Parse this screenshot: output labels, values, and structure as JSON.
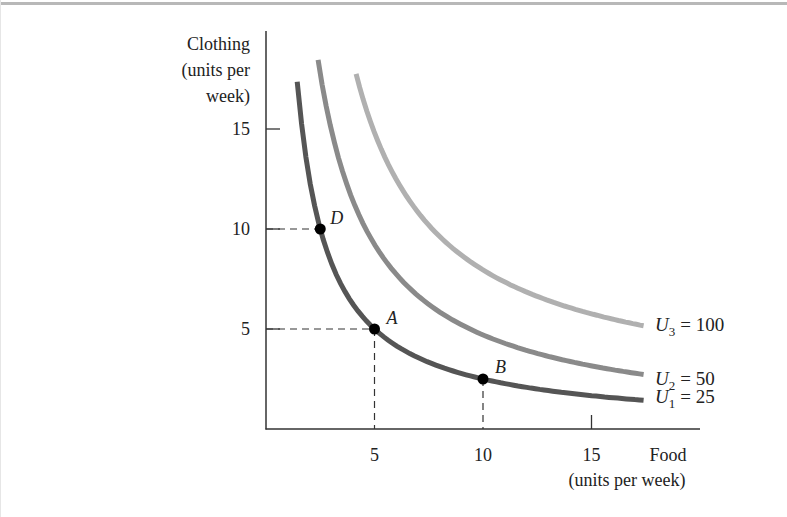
{
  "chart_data": {
    "type": "line",
    "title": "",
    "ylabel": [
      "Clothing",
      "(units per",
      "week)"
    ],
    "xlabel": [
      "Food",
      "(units per week)"
    ],
    "xlim": [
      0,
      19.5
    ],
    "ylim": [
      0,
      19.9
    ],
    "x_ticks": [
      5,
      10,
      15
    ],
    "y_ticks": [
      5,
      10,
      15
    ],
    "grid": false,
    "series": [
      {
        "name": "U1 = 25",
        "label_main": "U",
        "label_sub": "1",
        "label_value": "= 25",
        "color": "#555555",
        "utility": 25,
        "x0": 0,
        "y0": 0,
        "k": 25,
        "x_start": 1.44,
        "x_end": 17.4
      },
      {
        "name": "U2 = 50",
        "label_main": "U",
        "label_sub": "2",
        "label_value": "= 50",
        "color": "#8a8a8a",
        "utility": 50,
        "x0": -0.2,
        "y0": 0,
        "k": 48,
        "x_start": 2.4,
        "x_end": 17.4
      },
      {
        "name": "U3 = 100",
        "label_main": "U",
        "label_sub": "3",
        "label_value": "= 100",
        "color": "#b0b0b0",
        "utility": 100,
        "x0": 0.3,
        "y0": 1.5,
        "k": 62.6,
        "x_start": 4.15,
        "x_end": 17.4
      }
    ],
    "points": [
      {
        "label": "D",
        "x": 2.5,
        "y": 10,
        "guides": [
          "y"
        ]
      },
      {
        "label": "A",
        "x": 5,
        "y": 5,
        "guides": [
          "x",
          "y"
        ]
      },
      {
        "label": "B",
        "x": 10,
        "y": 2.5,
        "guides": [
          "x"
        ]
      }
    ]
  },
  "axes": {
    "y_tick_labels": [
      "5",
      "10",
      "15"
    ],
    "x_tick_labels": [
      "5",
      "10",
      "15"
    ]
  }
}
